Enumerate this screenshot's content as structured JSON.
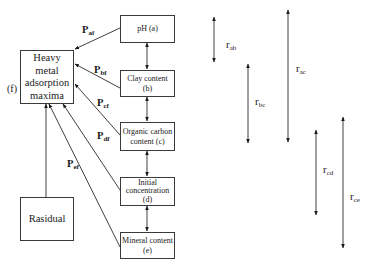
{
  "diagram": {
    "target": {
      "label": "Heavy metal adsorption maxima",
      "lines": [
        "Heavy metal",
        "adsorption",
        "maxima"
      ],
      "tag": "(f)"
    },
    "residual": {
      "label": "Rasidual"
    },
    "factors": [
      {
        "id": "a",
        "lines": [
          "pH (a)"
        ]
      },
      {
        "id": "b",
        "lines": [
          "Clay content",
          "(b)"
        ]
      },
      {
        "id": "c",
        "lines": [
          "Organic carbon",
          "content (c)"
        ]
      },
      {
        "id": "d",
        "lines": [
          "Initial",
          "concentration",
          "(d)"
        ]
      },
      {
        "id": "e",
        "lines": [
          "Mineral content",
          "(e)"
        ]
      }
    ],
    "path_coefficients": [
      {
        "base": "P",
        "sub": "af"
      },
      {
        "base": "P",
        "sub": "bf"
      },
      {
        "base": "P",
        "sub": "cf"
      },
      {
        "base": "P",
        "sub": "df"
      },
      {
        "base": "P",
        "sub": "ef"
      }
    ],
    "correlations": [
      {
        "base": "r",
        "sub": "ab"
      },
      {
        "base": "r",
        "sub": "bc"
      },
      {
        "base": "r",
        "sub": "ac"
      },
      {
        "base": "r",
        "sub": "cd"
      },
      {
        "base": "r",
        "sub": "ce"
      }
    ]
  }
}
